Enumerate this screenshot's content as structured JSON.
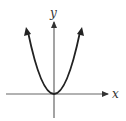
{
  "diagram": {
    "type": "parabola-graph",
    "equation_shape": "upward-opening parabola with vertex at origin",
    "x_axis_label": "x",
    "y_axis_label": "y",
    "colors": {
      "curve": "#222222",
      "axis": "#555555",
      "background": "#ffffff"
    }
  }
}
